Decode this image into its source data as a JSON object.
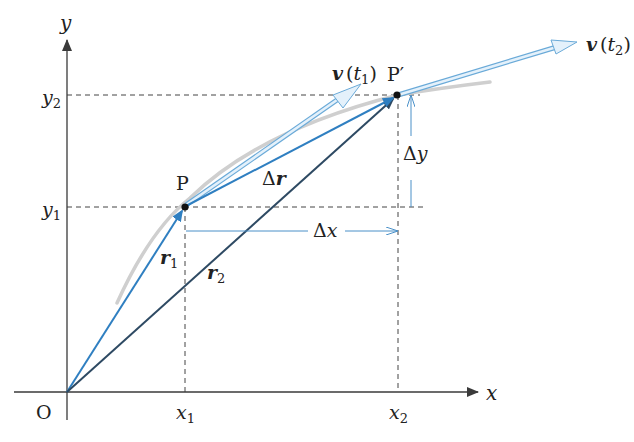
{
  "diagram": {
    "axes": {
      "x_label": "x",
      "y_label": "y",
      "origin_label": "O",
      "x_ticks": [
        {
          "label": "x",
          "sub": "1"
        },
        {
          "label": "x",
          "sub": "2"
        }
      ],
      "y_ticks": [
        {
          "label": "y",
          "sub": "1"
        },
        {
          "label": "y",
          "sub": "2"
        }
      ]
    },
    "points": {
      "p": {
        "label": "P"
      },
      "p_prime": {
        "label": "P′"
      }
    },
    "vectors": {
      "r1": {
        "label": "r",
        "sub": "1"
      },
      "r2": {
        "label": "r",
        "sub": "2"
      },
      "delta_r": {
        "prefix": "Δ",
        "label": "r"
      },
      "v_t1": {
        "label": "v",
        "arg_open": "(",
        "arg": "t",
        "sub": "1",
        "arg_close": ")"
      },
      "v_t2": {
        "label": "v",
        "arg_open": "(",
        "arg": "t",
        "sub": "2",
        "arg_close": ")"
      }
    },
    "deltas": {
      "dx": {
        "prefix": "Δ",
        "label": "x"
      },
      "dy": {
        "prefix": "Δ",
        "label": "y"
      }
    },
    "colors": {
      "axis": "#3a3a3a",
      "dashed": "#444444",
      "r1": "#2f7fc1",
      "r2": "#2e4a63",
      "delta_r": "#2f7fc1",
      "velocity_fill": "#dcecf8",
      "velocity_stroke": "#6aaad8",
      "path_curve": "#cfcfcf",
      "delta_arrow": "#4a90c8",
      "point": "#111111"
    }
  }
}
